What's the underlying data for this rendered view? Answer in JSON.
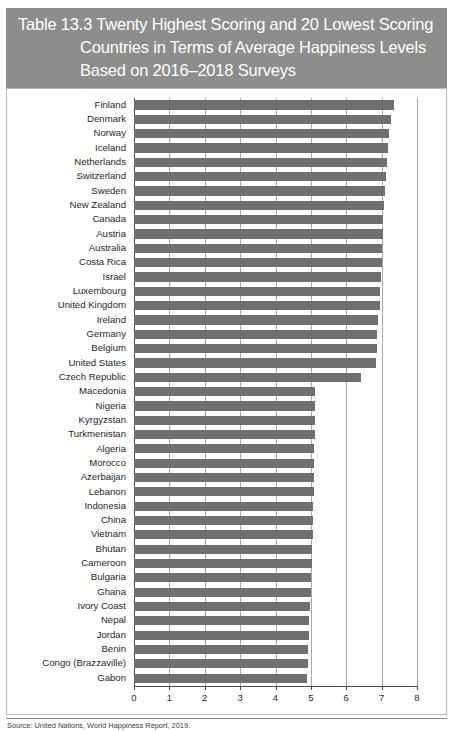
{
  "title": {
    "line1": "Table 13.3  Twenty Highest Scoring and 20 Lowest Scoring",
    "line2": "Countries in Terms of Average Happiness Levels",
    "line3": "Based on 2016–2018 Surveys"
  },
  "footnote": "Source: United Nations, World Happiness Report, 2019.",
  "colors": {
    "title_band": "#8d8d8d",
    "title_text": "#ffffff",
    "bar": "#6f6f6f",
    "gridline": "#a9a9a9",
    "axis": "#4a4a4a",
    "frame_border": "#b9b9b9",
    "page_background": "#ffffff"
  },
  "chart_data": {
    "type": "bar",
    "orientation": "horizontal",
    "title": "Twenty Highest Scoring and 20 Lowest Scoring Countries in Terms of Average Happiness Levels Based on 2016–2018 Surveys",
    "xlabel": "",
    "ylabel": "",
    "xlim": [
      0,
      8
    ],
    "xticks": [
      0,
      1,
      2,
      3,
      4,
      5,
      6,
      7,
      8
    ],
    "xticklabels": [
      "0",
      "1",
      "2",
      "3",
      "4",
      "5",
      "6",
      "7",
      "8"
    ],
    "grid": true,
    "grid_axis": "x",
    "legend": false,
    "series_name": "Average happiness level",
    "categories": [
      "Finland",
      "Denmark",
      "Norway",
      "Iceland",
      "Netherlands",
      "Switzerland",
      "Sweden",
      "New Zealand",
      "Canada",
      "Austria",
      "Australia",
      "Costa Rica",
      "Israel",
      "Luxembourg",
      "United Kingdom",
      "Ireland",
      "Germany",
      "Belgium",
      "United States",
      "Czech Republic",
      "Macedonia",
      "Nigeria",
      "Kyrgyzstan",
      "Turkmenistan",
      "Algeria",
      "Morocco",
      "Azerbaijan",
      "Lebanon",
      "Indonesia",
      "China",
      "Vietnam",
      "Bhutan",
      "Cameroon",
      "Bulgaria",
      "Ghana",
      "Ivory Coast",
      "Nepal",
      "Jordan",
      "Benin",
      "Congo (Brazzaville)",
      "Gabon"
    ],
    "values": [
      7.35,
      7.27,
      7.21,
      7.18,
      7.14,
      7.12,
      7.1,
      7.06,
      7.05,
      7.03,
      7.02,
      7.0,
      6.99,
      6.96,
      6.94,
      6.91,
      6.88,
      6.86,
      6.83,
      6.43,
      5.13,
      5.12,
      5.12,
      5.11,
      5.1,
      5.09,
      5.09,
      5.08,
      5.07,
      5.06,
      5.05,
      5.04,
      5.03,
      5.01,
      5.0,
      4.98,
      4.96,
      4.95,
      4.93,
      4.91,
      4.89
    ]
  }
}
